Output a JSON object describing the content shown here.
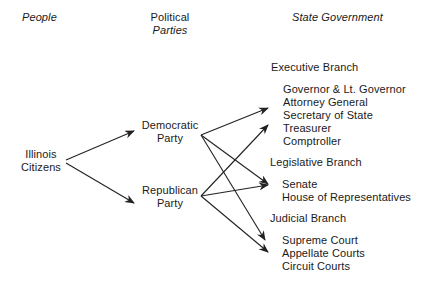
{
  "headers": {
    "people": "People",
    "political_line1": "Political",
    "political_line2": "Parties",
    "state_government": "State Government"
  },
  "people": {
    "line1": "Illinois",
    "line2": "Citizens"
  },
  "parties": [
    {
      "line1": "Democratic",
      "line2": "Party"
    },
    {
      "line1": "Republican",
      "line2": "Party"
    }
  ],
  "branches": [
    {
      "title": "Executive Branch",
      "members": [
        "Governor & Lt. Governor",
        "Attorney General",
        "Secretary of State",
        "Treasurer",
        "Comptroller"
      ]
    },
    {
      "title": "Legislative Branch",
      "members": [
        "Senate",
        "House of Representatives"
      ]
    },
    {
      "title": "Judicial Branch",
      "members": [
        "Supreme Court",
        "Appellate Courts",
        "Circuit Courts"
      ]
    }
  ],
  "colors": {
    "text": "#1a1a1a",
    "arrow": "#222222",
    "background": "#ffffff"
  }
}
